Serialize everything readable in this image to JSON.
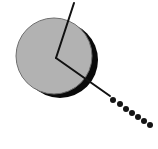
{
  "figure": {
    "canvas": {
      "width": 158,
      "height": 149,
      "background": "#ffffff"
    },
    "colors": {
      "sphere_fill": "#b2b2b2",
      "sphere_outline": "#6e6e6e",
      "shadow_fill": "#0a0a0a",
      "line_stroke": "#111111",
      "dot_fill": "#141414",
      "background": "#ffffff"
    },
    "shadow_disc": {
      "label": "shadow-crescent",
      "cx": 60,
      "cy": 60,
      "r": 38
    },
    "sphere": {
      "label": "gray-ball",
      "cx": 54,
      "cy": 56,
      "r": 38,
      "stroke_width": 1
    },
    "angle_marker": {
      "label": "angle-indicator",
      "vertex": {
        "x": 56,
        "y": 58
      },
      "upper_end": {
        "x": 74,
        "y": 3
      },
      "lower_end": {
        "x": 110,
        "y": 96
      },
      "stroke_width": 2
    },
    "trail": {
      "label": "motion-trail",
      "dot_count": 7,
      "dot_radius": 3,
      "dots": [
        {
          "x": 113,
          "y": 100
        },
        {
          "x": 120,
          "y": 104
        },
        {
          "x": 126,
          "y": 109
        },
        {
          "x": 132,
          "y": 113
        },
        {
          "x": 138,
          "y": 117
        },
        {
          "x": 144,
          "y": 121
        },
        {
          "x": 150,
          "y": 125
        }
      ]
    }
  }
}
